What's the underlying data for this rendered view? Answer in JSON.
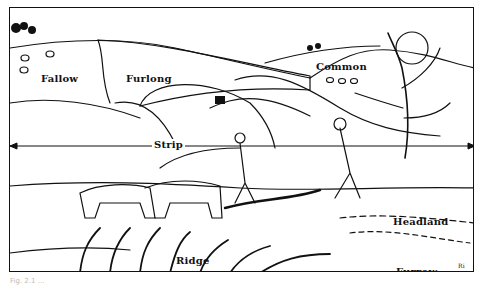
{
  "figure": {
    "caption": "Fig. 2.1 ...",
    "labels": {
      "fallow": "Fallow",
      "furlong": "Furlong",
      "common": "Common",
      "strip": "Strip",
      "headland": "Headland",
      "ridge": "Ridge",
      "furrow": "Furrow"
    },
    "signature": "Ri",
    "colors": {
      "ink": "#111111",
      "paper": "#ffffff"
    }
  }
}
